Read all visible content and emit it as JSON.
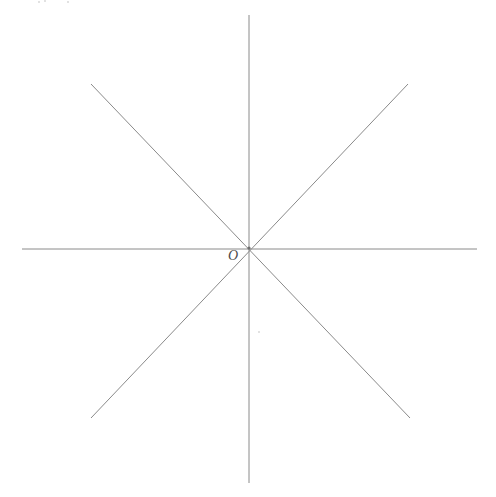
{
  "figure": {
    "background_color": "#ffffff",
    "line_color": "#8a8a8a",
    "line_width": 1,
    "canvas": {
      "width": 496,
      "height": 497
    },
    "origin": {
      "x": 249,
      "y": 248
    },
    "origin_label": {
      "text": "O",
      "x": 228,
      "y": 249,
      "style": "italic",
      "color": "#4a4a4a",
      "font_size": 14
    },
    "lines": [
      {
        "name": "horizontal-axis",
        "x1": 22,
        "y1": 249,
        "x2": 477,
        "y2": 249
      },
      {
        "name": "vertical-axis",
        "x1": 249,
        "y1": 15,
        "x2": 249,
        "y2": 483
      },
      {
        "name": "diagonal-nwse",
        "x1": 91,
        "y1": 84,
        "x2": 410,
        "y2": 418
      },
      {
        "name": "diagonal-swne",
        "x1": 91,
        "y1": 418,
        "x2": 408,
        "y2": 84
      }
    ],
    "specks": [
      {
        "name": "scan-speck-top-a",
        "x": 38,
        "y": 1,
        "size": 2
      },
      {
        "name": "scan-speck-top-b",
        "x": 44,
        "y": 0,
        "size": 2
      },
      {
        "name": "scan-speck-top-c",
        "x": 67,
        "y": 1,
        "size": 2
      },
      {
        "name": "scan-speck-mid",
        "x": 258,
        "y": 331,
        "size": 2
      }
    ]
  },
  "chart_data": {
    "type": "line",
    "xlabel": "",
    "ylabel": "",
    "xlim": [
      22,
      477
    ],
    "ylim": [
      15,
      483
    ],
    "grid": false,
    "legend": null,
    "annotations": [
      {
        "text": "O",
        "x": 249,
        "y": 248,
        "note": "origin point label"
      }
    ],
    "series": [
      {
        "name": "horizontal-axis",
        "angle_degrees": 0,
        "x": [
          22,
          477
        ],
        "y": [
          249,
          249
        ]
      },
      {
        "name": "vertical-axis",
        "angle_degrees": 90,
        "x": [
          249,
          249
        ],
        "y": [
          15,
          483
        ]
      },
      {
        "name": "diagonal-nwse",
        "angle_degrees": -46,
        "x": [
          91,
          410
        ],
        "y": [
          84,
          418
        ]
      },
      {
        "name": "diagonal-swne",
        "angle_degrees": 46,
        "x": [
          91,
          408
        ],
        "y": [
          418,
          84
        ]
      }
    ]
  }
}
